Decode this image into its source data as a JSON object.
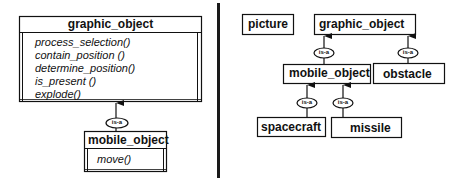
{
  "left_panel": {
    "parent_class": {
      "name": "graphic_object",
      "methods": [
        "process_selection()",
        "contain_position ()",
        "determine_position()",
        "is_present ()",
        "explode()"
      ]
    },
    "relation_label": "is-a",
    "child_class": {
      "name": "mobile_object",
      "methods": [
        "move()"
      ]
    }
  },
  "right_panel": {
    "nodes": {
      "picture": "picture",
      "graphic_object": "graphic_object",
      "mobile_object": "mobile_object",
      "obstacle": "obstacle",
      "spacecraft": "spacecraft",
      "missile": "missile"
    },
    "relation_label": "is-a",
    "edges": [
      {
        "from": "mobile_object",
        "to": "graphic_object",
        "label": "is-a"
      },
      {
        "from": "obstacle",
        "to": "graphic_object",
        "label": "is-a"
      },
      {
        "from": "spacecraft",
        "to": "mobile_object",
        "label": "is-a"
      },
      {
        "from": "missile",
        "to": "mobile_object",
        "label": "is-a"
      }
    ]
  }
}
